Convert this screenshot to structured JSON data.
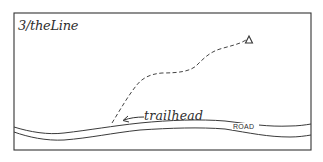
{
  "diagram": {
    "title": "3/theLine",
    "labels": {
      "trailhead": "trailhead",
      "road": "ROAD"
    },
    "markers": {
      "summit_icon": "triangle-summit-icon"
    },
    "colors": {
      "ink": "#333333",
      "background": "#ffffff"
    }
  }
}
